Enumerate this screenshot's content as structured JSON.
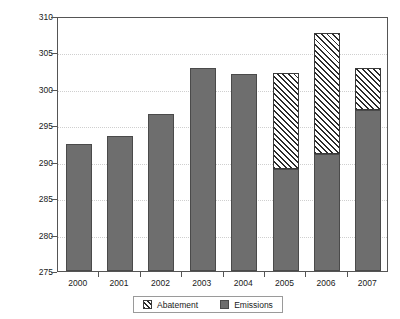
{
  "title_remnant": "",
  "axis": {
    "ylabel_main": "Million tonnes CO",
    "ylabel_sub": "2"
  },
  "legend": {
    "abatement_label": "Abatement",
    "emissions_label": "Emissions"
  },
  "chart_data": {
    "type": "bar",
    "stacked": true,
    "title": "",
    "xlabel": "",
    "ylabel": "Million tonnes CO2",
    "ylim": [
      275,
      310
    ],
    "ytick_labels": [
      "310",
      "305",
      "300",
      "295",
      "290",
      "285",
      "280",
      "275"
    ],
    "ytick_values": [
      310,
      305,
      300,
      295,
      290,
      285,
      280,
      275
    ],
    "grid": true,
    "legend_position": "bottom-center",
    "categories": [
      "2000",
      "2001",
      "2002",
      "2003",
      "2004",
      "2005",
      "2006",
      "2007"
    ],
    "series": [
      {
        "name": "Emissions",
        "color": "#6e6e6e",
        "values": [
          292.5,
          293.5,
          296.5,
          302.8,
          302.1,
          289.0,
          291.1,
          297.1
        ]
      },
      {
        "name": "Abatement",
        "color": "#ffffff",
        "hatch": "diagonal",
        "values": [
          0,
          0,
          0,
          0,
          0,
          13.2,
          16.5,
          5.7
        ],
        "stack_tops": [
          null,
          null,
          null,
          null,
          null,
          302.2,
          307.6,
          302.8
        ]
      }
    ]
  }
}
